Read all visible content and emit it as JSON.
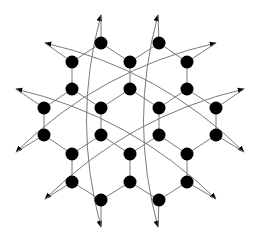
{
  "diagram": {
    "width": 258,
    "height": 238,
    "background": "#ffffff",
    "edge_color": "#7a7a7a",
    "node_color": "#000000",
    "node_radius": 6.5,
    "nodes": [
      {
        "id": "n1",
        "x": 101,
        "y": 43
      },
      {
        "id": "n2",
        "x": 159,
        "y": 43
      },
      {
        "id": "n3",
        "x": 72,
        "y": 62
      },
      {
        "id": "n4",
        "x": 130,
        "y": 62
      },
      {
        "id": "n5",
        "x": 187,
        "y": 62
      },
      {
        "id": "n6",
        "x": 72,
        "y": 89
      },
      {
        "id": "n7",
        "x": 130,
        "y": 89
      },
      {
        "id": "n8",
        "x": 187,
        "y": 89
      },
      {
        "id": "n9",
        "x": 44,
        "y": 108
      },
      {
        "id": "n10",
        "x": 101,
        "y": 108
      },
      {
        "id": "n11",
        "x": 159,
        "y": 108
      },
      {
        "id": "n12",
        "x": 216,
        "y": 108
      },
      {
        "id": "n13",
        "x": 44,
        "y": 135
      },
      {
        "id": "n14",
        "x": 101,
        "y": 135
      },
      {
        "id": "n15",
        "x": 159,
        "y": 135
      },
      {
        "id": "n16",
        "x": 216,
        "y": 135
      },
      {
        "id": "n17",
        "x": 72,
        "y": 154
      },
      {
        "id": "n18",
        "x": 130,
        "y": 154
      },
      {
        "id": "n19",
        "x": 187,
        "y": 154
      },
      {
        "id": "n20",
        "x": 72,
        "y": 182
      },
      {
        "id": "n21",
        "x": 130,
        "y": 182
      },
      {
        "id": "n22",
        "x": 187,
        "y": 182
      },
      {
        "id": "n23",
        "x": 101,
        "y": 200
      },
      {
        "id": "n24",
        "x": 159,
        "y": 200
      }
    ],
    "edges": [
      [
        "n1",
        "n3"
      ],
      [
        "n1",
        "n4"
      ],
      [
        "n2",
        "n4"
      ],
      [
        "n2",
        "n5"
      ],
      [
        "n3",
        "n6"
      ],
      [
        "n4",
        "n7"
      ],
      [
        "n5",
        "n8"
      ],
      [
        "n6",
        "n9"
      ],
      [
        "n6",
        "n10"
      ],
      [
        "n7",
        "n10"
      ],
      [
        "n7",
        "n11"
      ],
      [
        "n8",
        "n11"
      ],
      [
        "n8",
        "n12"
      ],
      [
        "n9",
        "n13"
      ],
      [
        "n10",
        "n14"
      ],
      [
        "n11",
        "n15"
      ],
      [
        "n12",
        "n16"
      ],
      [
        "n13",
        "n17"
      ],
      [
        "n14",
        "n17"
      ],
      [
        "n14",
        "n18"
      ],
      [
        "n15",
        "n18"
      ],
      [
        "n15",
        "n19"
      ],
      [
        "n16",
        "n19"
      ],
      [
        "n17",
        "n20"
      ],
      [
        "n18",
        "n21"
      ],
      [
        "n19",
        "n22"
      ],
      [
        "n20",
        "n23"
      ],
      [
        "n21",
        "n23"
      ],
      [
        "n21",
        "n24"
      ],
      [
        "n22",
        "n24"
      ]
    ],
    "arrow_stubs": [
      {
        "tip": [
          45,
          43
        ],
        "node": "n3"
      },
      {
        "tip": [
          216,
          43
        ],
        "node": "n5"
      },
      {
        "tip": [
          16,
          89
        ],
        "node": "n9"
      },
      {
        "tip": [
          244,
          89
        ],
        "node": "n12"
      },
      {
        "tip": [
          16,
          152
        ],
        "node": "n13"
      },
      {
        "tip": [
          244,
          152
        ],
        "node": "n16"
      },
      {
        "tip": [
          45,
          199
        ],
        "node": "n20"
      },
      {
        "tip": [
          216,
          199
        ],
        "node": "n22"
      },
      {
        "tip": [
          101,
          15
        ],
        "node": "n1"
      },
      {
        "tip": [
          158,
          15
        ],
        "node": "n2"
      },
      {
        "tip": [
          101,
          227
        ],
        "node": "n23"
      },
      {
        "tip": [
          158,
          227
        ],
        "node": "n24"
      }
    ],
    "curves": [
      {
        "from": [
          45,
          43
        ],
        "ctrl": [
          160,
          69
        ],
        "to": [
          244,
          152
        ]
      },
      {
        "from": [
          216,
          43
        ],
        "ctrl": [
          100,
          69
        ],
        "to": [
          16,
          152
        ]
      },
      {
        "from": [
          16,
          89
        ],
        "ctrl": [
          131,
          116
        ],
        "to": [
          216,
          199
        ]
      },
      {
        "from": [
          244,
          89
        ],
        "ctrl": [
          129,
          116
        ],
        "to": [
          45,
          199
        ]
      },
      {
        "from": [
          101,
          15
        ],
        "ctrl": [
          72,
          121
        ],
        "to": [
          101,
          227
        ]
      },
      {
        "from": [
          158,
          15
        ],
        "ctrl": [
          129,
          121
        ],
        "to": [
          158,
          227
        ]
      }
    ]
  }
}
